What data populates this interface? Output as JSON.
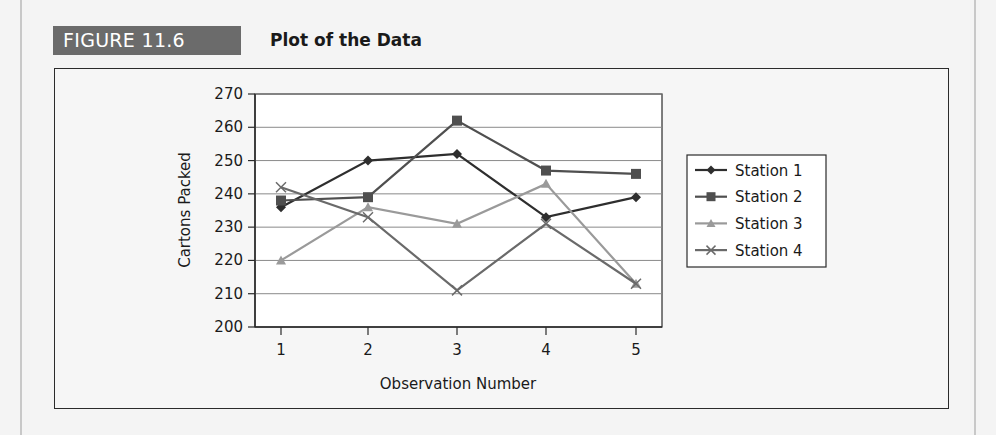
{
  "figure": {
    "label": "FIGURE 11.6",
    "title": "Plot of the Data",
    "badge_color": "#6b6b6b"
  },
  "chart_data": {
    "type": "line",
    "title": "Plot of the Data",
    "xlabel": "Observation Number",
    "ylabel": "Cartons Packed",
    "x": [
      1,
      2,
      3,
      4,
      5
    ],
    "x_tick_labels": [
      "1",
      "2",
      "3",
      "4",
      "5"
    ],
    "y_tick_labels": [
      "200",
      "210",
      "220",
      "230",
      "240",
      "250",
      "260",
      "270"
    ],
    "ylim": [
      200,
      270
    ],
    "grid": true,
    "legend_position": "right",
    "series": [
      {
        "name": "Station 1",
        "marker": "diamond",
        "color": "#2e2e2e",
        "values": [
          236,
          250,
          252,
          233,
          239
        ]
      },
      {
        "name": "Station 2",
        "marker": "square",
        "color": "#4f4f4f",
        "values": [
          238,
          239,
          262,
          247,
          246
        ]
      },
      {
        "name": "Station 3",
        "marker": "triangle",
        "color": "#9a9a9a",
        "values": [
          220,
          236,
          231,
          243,
          213
        ]
      },
      {
        "name": "Station 4",
        "marker": "x",
        "color": "#6a6a6a",
        "values": [
          242,
          233,
          211,
          231,
          213
        ]
      }
    ]
  }
}
